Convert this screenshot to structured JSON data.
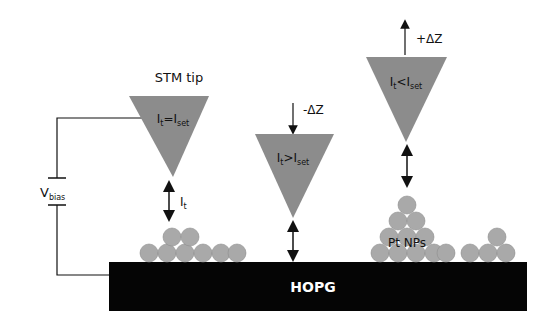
{
  "diagram": {
    "title_tip": "STM tip",
    "substrate_label": "HOPG",
    "nanoparticles_label": "Pt NPs",
    "bias": {
      "main": "V",
      "sub": "bias"
    },
    "current": {
      "main": "I",
      "sub": "t"
    },
    "tips": [
      {
        "id": "tip-1",
        "cond_main": "I",
        "cond_sub1": "t",
        "cond_op": "=",
        "cond_main2": "I",
        "cond_sub2": "set"
      },
      {
        "id": "tip-2",
        "cond_main": "I",
        "cond_sub1": "t",
        "cond_op": ">",
        "cond_main2": "I",
        "cond_sub2": "set",
        "move": "-ΔZ"
      },
      {
        "id": "tip-3",
        "cond_main": "I",
        "cond_sub1": "t",
        "cond_op": "<",
        "cond_main2": "I",
        "cond_sub2": "set",
        "move": "+ΔZ"
      }
    ],
    "colors": {
      "tip_fill": "#8c8c8c",
      "particle_fill": "#a9a9a9",
      "substrate_fill": "#050505",
      "substrate_text": "#ffffff",
      "line": "#111111"
    }
  }
}
